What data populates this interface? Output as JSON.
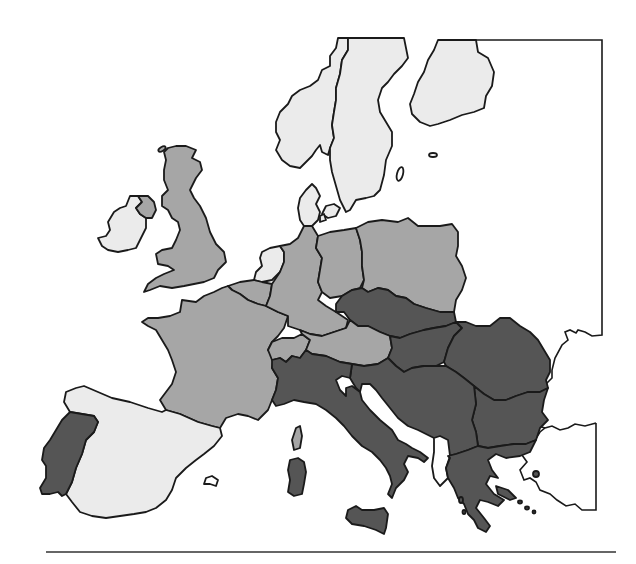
{
  "map": {
    "title": "",
    "type": "choropleth",
    "palette": {
      "light": "#ebebeb",
      "medium": "#a6a6a6",
      "dark": "#555555",
      "sea": "#ffffff",
      "border": "#1a1a1a"
    },
    "legend": [],
    "regions": [
      {
        "name": "Iceland-area-none",
        "shade": "none"
      },
      {
        "name": "Ireland",
        "shade": "light"
      },
      {
        "name": "Northern Ireland",
        "shade": "medium"
      },
      {
        "name": "United Kingdom",
        "shade": "medium"
      },
      {
        "name": "Norway",
        "shade": "light"
      },
      {
        "name": "Sweden",
        "shade": "light"
      },
      {
        "name": "Finland",
        "shade": "light"
      },
      {
        "name": "Denmark",
        "shade": "light"
      },
      {
        "name": "Netherlands",
        "shade": "light"
      },
      {
        "name": "Belgium",
        "shade": "medium"
      },
      {
        "name": "France",
        "shade": "medium"
      },
      {
        "name": "West Germany",
        "shade": "medium"
      },
      {
        "name": "East Germany",
        "shade": "medium"
      },
      {
        "name": "Poland",
        "shade": "medium"
      },
      {
        "name": "Switzerland",
        "shade": "medium"
      },
      {
        "name": "Austria",
        "shade": "medium"
      },
      {
        "name": "Czechoslovakia",
        "shade": "dark"
      },
      {
        "name": "Hungary",
        "shade": "dark"
      },
      {
        "name": "Romania",
        "shade": "dark"
      },
      {
        "name": "Yugoslavia",
        "shade": "dark"
      },
      {
        "name": "Bulgaria",
        "shade": "dark"
      },
      {
        "name": "Albania",
        "shade": "none"
      },
      {
        "name": "Greece",
        "shade": "dark"
      },
      {
        "name": "Italy",
        "shade": "dark"
      },
      {
        "name": "Sicily",
        "shade": "dark"
      },
      {
        "name": "Sardinia",
        "shade": "dark"
      },
      {
        "name": "Corsica",
        "shade": "medium"
      },
      {
        "name": "Spain",
        "shade": "light"
      },
      {
        "name": "Portugal",
        "shade": "dark"
      },
      {
        "name": "Turkey",
        "shade": "none"
      },
      {
        "name": "USSR",
        "shade": "none"
      }
    ],
    "footer_rule": true
  }
}
